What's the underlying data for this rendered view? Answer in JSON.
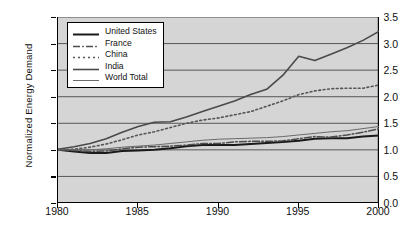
{
  "chart_data": {
    "type": "line",
    "title": "",
    "xlabel": "",
    "ylabel": "Normalized  Energy Demand",
    "xlim": [
      1980,
      2000
    ],
    "ylim": [
      0.0,
      3.5
    ],
    "grid": true,
    "grid_axis": "y",
    "legend_position": "top-left",
    "x_ticks": [
      "1980",
      "1985",
      "1990",
      "1995",
      "2000"
    ],
    "x_tick_values": [
      1980,
      1985,
      1990,
      1995,
      2000
    ],
    "y_ticks": [
      "0.0",
      "0.5",
      "1.0",
      "1.5",
      "2.0",
      "2.5",
      "3.0",
      "3.5"
    ],
    "y_tick_values": [
      0.0,
      0.5,
      1.0,
      1.5,
      2.0,
      2.5,
      3.0,
      3.5
    ],
    "x": [
      1980,
      1981,
      1982,
      1983,
      1984,
      1985,
      1986,
      1987,
      1988,
      1989,
      1990,
      1991,
      1992,
      1993,
      1994,
      1995,
      1996,
      1997,
      1998,
      1999,
      2000
    ],
    "series": [
      {
        "name": "United States",
        "style": "solid",
        "width": 2.0,
        "color": "#1a1a1a",
        "values": [
          1.0,
          0.97,
          0.94,
          0.94,
          0.98,
          0.99,
          1.0,
          1.03,
          1.07,
          1.09,
          1.09,
          1.09,
          1.11,
          1.13,
          1.15,
          1.17,
          1.21,
          1.22,
          1.22,
          1.25,
          1.27
        ]
      },
      {
        "name": "France",
        "style": "dash-dot",
        "width": 1.5,
        "color": "#4d4d4d",
        "values": [
          1.0,
          0.99,
          0.97,
          0.98,
          1.02,
          1.05,
          1.06,
          1.07,
          1.09,
          1.12,
          1.12,
          1.15,
          1.16,
          1.16,
          1.17,
          1.21,
          1.25,
          1.24,
          1.28,
          1.33,
          1.4
        ]
      },
      {
        "name": "China",
        "style": "dotted",
        "width": 1.6,
        "color": "#555555",
        "values": [
          1.0,
          1.01,
          1.05,
          1.11,
          1.19,
          1.28,
          1.34,
          1.42,
          1.5,
          1.56,
          1.6,
          1.66,
          1.72,
          1.82,
          1.92,
          2.04,
          2.11,
          2.15,
          2.16,
          2.16,
          2.22
        ]
      },
      {
        "name": "India",
        "style": "solid",
        "width": 1.6,
        "color": "#4a4a4a",
        "values": [
          1.01,
          1.06,
          1.12,
          1.21,
          1.33,
          1.44,
          1.52,
          1.53,
          1.62,
          1.72,
          1.82,
          1.92,
          2.04,
          2.14,
          2.4,
          2.76,
          2.68,
          2.8,
          2.92,
          3.06,
          3.23
        ]
      },
      {
        "name": "World Total",
        "style": "solid",
        "width": 1.0,
        "color": "#6a6a6a",
        "values": [
          1.0,
          1.0,
          1.0,
          1.02,
          1.05,
          1.07,
          1.09,
          1.12,
          1.15,
          1.18,
          1.2,
          1.21,
          1.22,
          1.23,
          1.25,
          1.28,
          1.31,
          1.34,
          1.36,
          1.4,
          1.44
        ]
      }
    ]
  },
  "colors": {
    "plot_background": "#d5d5d5",
    "page_background": "#ffffff",
    "axis": "#000000",
    "gridline": "#4a4a4a",
    "text": "#111111"
  }
}
